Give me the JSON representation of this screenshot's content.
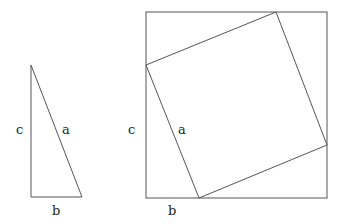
{
  "diagram": {
    "triangle": {
      "vertices": {
        "apex": [
          31,
          65
        ],
        "right_angle": [
          31,
          197
        ],
        "base_end": [
          82,
          197
        ]
      },
      "labels": {
        "vertical_side": "c",
        "hypotenuse": "a",
        "base": "b"
      }
    },
    "square": {
      "outer": {
        "x": 146,
        "y": 12,
        "width": 181,
        "height": 186
      },
      "inner": [
        [
          146,
          65
        ],
        [
          276,
          12
        ],
        [
          327,
          145
        ],
        [
          199,
          198
        ]
      ],
      "labels": {
        "left_side": "c",
        "tilted_side": "a",
        "bottom_segment": "b"
      }
    }
  }
}
